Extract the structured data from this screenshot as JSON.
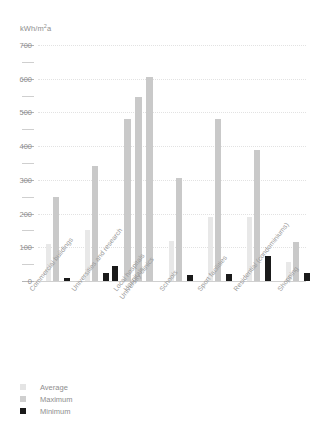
{
  "chart_data": {
    "type": "bar",
    "title": "",
    "subtitle": "",
    "xlabel": "",
    "ylabel": "kWh/m²a",
    "ylim": [
      0,
      700
    ],
    "yticks": [
      0,
      100,
      200,
      300,
      400,
      500,
      600,
      700
    ],
    "ytick_labels": [
      "0",
      "100",
      "200",
      "300",
      "400",
      "500",
      "600",
      "700"
    ],
    "minor_tick_step": 50,
    "grid": true,
    "grid_style": "dotted-horizontal",
    "legend_position": "bottom-left",
    "legend": [
      "Average",
      "Maximum",
      "Minimum"
    ],
    "categories": [
      "Commercial buildings",
      "Universities and research",
      "Local hospitals",
      "Hospitals",
      "University clinics",
      "Schools",
      "Sport facilities",
      "Residential (condominiums)",
      "Shopping"
    ],
    "series": [
      {
        "name": "Average",
        "color": "#e8e8e8",
        "values": [
          110,
          150,
          480,
          545,
          605,
          120,
          190,
          190,
          55
        ]
      },
      {
        "name": "Maximum",
        "color": "#c9c9c9",
        "values": [
          250,
          340,
          480,
          545,
          605,
          305,
          480,
          390,
          115
        ]
      },
      {
        "name": "Minimum",
        "color": "#1a1a1a",
        "values": [
          10,
          25,
          45,
          45,
          45,
          18,
          20,
          75,
          25
        ]
      }
    ]
  },
  "axis": {
    "unit_prefix": "kWh/m",
    "unit_exponent": "2",
    "unit_suffix": "a"
  },
  "legend": {
    "items": [
      {
        "label": "Average",
        "swatch": "average"
      },
      {
        "label": "Maximum",
        "swatch": "maximum"
      },
      {
        "label": "Minimum",
        "swatch": "minimum"
      }
    ]
  },
  "colors": {
    "average": "#e8e8e8",
    "maximum": "#c9c9c9",
    "minimum": "#1a1a1a",
    "grid": "#e2e2e2",
    "text": "#8e8e8e",
    "baseline": "#d0d0d0"
  }
}
